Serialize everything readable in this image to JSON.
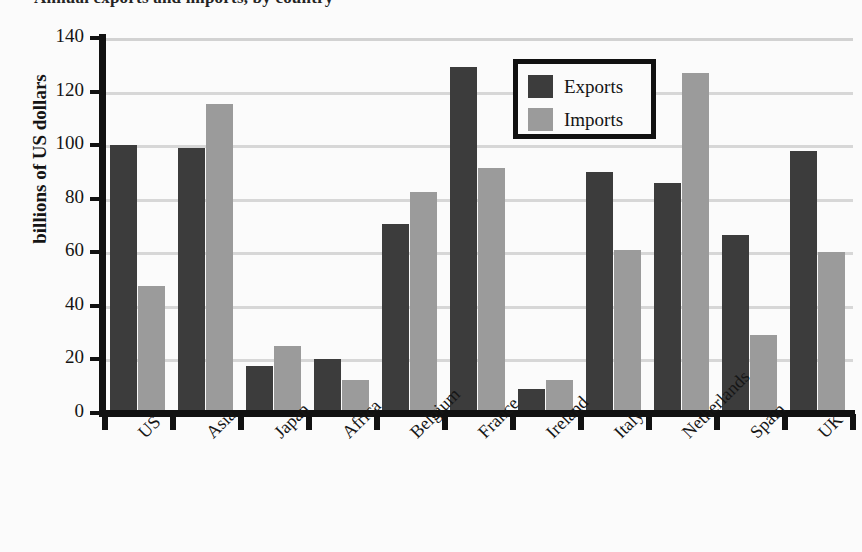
{
  "chart_data": {
    "type": "bar",
    "title": "Annual exports and imports, by country",
    "xlabel": "",
    "ylabel": "billions of US dollars",
    "ylim": [
      0,
      140
    ],
    "yticks": [
      0,
      20,
      40,
      60,
      80,
      100,
      120,
      140
    ],
    "grid": true,
    "legend_position": "upper-center",
    "categories": [
      "US",
      "Asia",
      "Japan",
      "Africa",
      "Belgium",
      "France",
      "Ireland",
      "Italy",
      "Netherlands",
      "Spain",
      "UK"
    ],
    "series": [
      {
        "name": "Exports",
        "color": "#3c3c3c",
        "values": [
          100,
          99,
          17.5,
          20,
          70.5,
          129,
          9,
          90,
          86,
          66.5,
          98
        ]
      },
      {
        "name": "Imports",
        "color": "#9b9b9b",
        "values": [
          47.5,
          115.5,
          25,
          12.5,
          82.5,
          91.5,
          12.5,
          61,
          127,
          29,
          60
        ]
      }
    ]
  },
  "legend": {
    "entries": [
      {
        "label": "Exports",
        "swatch": "exports"
      },
      {
        "label": "Imports",
        "swatch": "imports"
      }
    ]
  }
}
